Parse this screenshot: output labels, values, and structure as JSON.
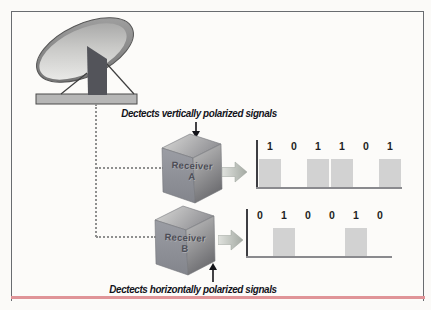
{
  "figure": {
    "type": "diagram"
  },
  "labels": {
    "top_annotation": "Dectects vertically polarized signals",
    "bottom_annotation": "Dectects horizontally polarized signals"
  },
  "receivers": [
    {
      "line1": "Receiver",
      "line2": "A"
    },
    {
      "line1": "Receiver",
      "line2": "B"
    }
  ],
  "chart_data": [
    {
      "type": "digital-waveform",
      "series": "Receiver A output",
      "bits": [
        1,
        0,
        1,
        1,
        0,
        1
      ]
    },
    {
      "type": "digital-waveform",
      "series": "Receiver B output",
      "bits": [
        0,
        1,
        0,
        0,
        1,
        0
      ]
    }
  ],
  "colors": {
    "frame_border": "#696c70",
    "accent_rule": "#e09498",
    "signal_block": "#d2d2d2",
    "connector": "#8f8f8f",
    "annotation_text": "#14141c",
    "digit_text": "#1e1e24"
  }
}
